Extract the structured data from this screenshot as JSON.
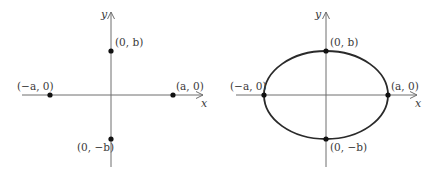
{
  "figure": {
    "left_panel": {
      "title": "Vertices and co-vertices",
      "x_axis_label": "x",
      "y_axis_label": "y",
      "points": [
        {
          "id": "top",
          "label": "(0, b)"
        },
        {
          "id": "right",
          "label": "(a, 0)"
        },
        {
          "id": "left",
          "label": "(−a, 0)"
        },
        {
          "id": "bottom",
          "label": "(0, −b)"
        }
      ]
    },
    "right_panel": {
      "title": "Ellipse through vertices",
      "x_axis_label": "x",
      "y_axis_label": "y",
      "points": [
        {
          "id": "top",
          "label": "(0, b)"
        },
        {
          "id": "right",
          "label": "(a, 0)"
        },
        {
          "id": "left",
          "label": "(−a, 0)"
        },
        {
          "id": "bottom",
          "label": "(0, −b)"
        }
      ]
    },
    "colors": {
      "axis": "#6e6e6e",
      "curve": "#2a2a2a",
      "point": "#111111",
      "text": "#3a3a3a"
    }
  }
}
